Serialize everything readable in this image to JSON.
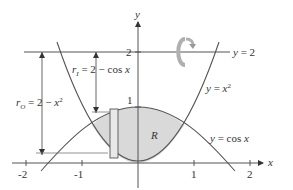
{
  "figure": {
    "axes": {
      "x_label": "x",
      "y_label": "y",
      "x_ticks": [
        "-2",
        "-1",
        "1",
        "2"
      ],
      "y_ticks": [
        "1",
        "2"
      ]
    },
    "curves": {
      "parabola": "y = x",
      "parabola_exp": "2",
      "cosine": "y = cos x",
      "line": "y = 2"
    },
    "region_label": "R",
    "radii": {
      "inner_lhs": "r",
      "inner_sub": "I",
      "inner_rhs": " = 2 − cos x",
      "outer_lhs": "r",
      "outer_sub": "O",
      "outer_rhs": " = 2 − x",
      "outer_exp": "2"
    },
    "rotation_icon": "rotation-arrow-icon",
    "colors": {
      "stroke": "#555555",
      "region_fill": "#d9d9d9",
      "rotation_arrow": "#b0b0b0"
    }
  }
}
